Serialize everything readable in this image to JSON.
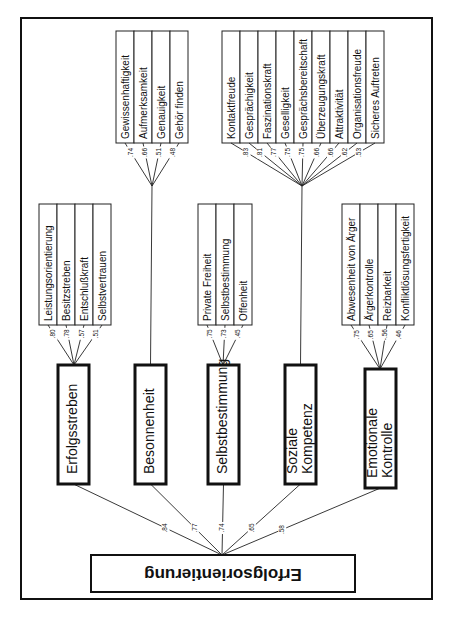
{
  "diagram": {
    "root": {
      "label": "Erfolgsorientierung"
    },
    "factors": [
      {
        "id": "erfolgsstreben",
        "label": [
          "Erfolgsstreben"
        ],
        "loading": ".84",
        "box": {
          "x": 58,
          "y": 365,
          "w": 31,
          "h": 119
        },
        "subs_box": {
          "x": 39,
          "y": 204,
          "w": 18,
          "h": 121,
          "gap": 0
        },
        "junction": {
          "x": 74,
          "y": 365
        },
        "sub_traits": [
          {
            "label": "Leistungsorientierung",
            "loading": ".80"
          },
          {
            "label": "Besitzstreben",
            "loading": ".78"
          },
          {
            "label": "Entschlußkraft",
            "loading": ".57"
          },
          {
            "label": "Selbstvertrauen",
            "loading": ".51"
          }
        ]
      },
      {
        "id": "besonnenheit",
        "label": [
          "Besonnenheit"
        ],
        "loading": ".77",
        "box": {
          "x": 135,
          "y": 365,
          "w": 31,
          "h": 119
        },
        "subs_box": {
          "x": 116,
          "y": 31,
          "w": 18,
          "h": 112,
          "gap": 0
        },
        "junction": {
          "x": 152,
          "y": 186
        },
        "sub_traits": [
          {
            "label": "Gewissenhaftigkeit",
            "loading": ".74"
          },
          {
            "label": "Aufmerksamkeit",
            "loading": ".66"
          },
          {
            "label": "Genauigkeit",
            "loading": ".51"
          },
          {
            "label": "Gehör finden",
            "loading": ".48"
          }
        ]
      },
      {
        "id": "selbstbestimmung",
        "label": [
          "Selbstbestimmung"
        ],
        "loading": ".74",
        "box": {
          "x": 208,
          "y": 365,
          "w": 31,
          "h": 119
        },
        "subs_box": {
          "x": 198,
          "y": 204,
          "w": 18,
          "h": 121,
          "gap": 0
        },
        "junction": {
          "x": 223,
          "y": 365
        },
        "sub_traits": [
          {
            "label": "Private Freiheit",
            "loading": ".75"
          },
          {
            "label": "Selbstbestimmung",
            "loading": ".73"
          },
          {
            "label": "Offenheit",
            "loading": ".45"
          }
        ]
      },
      {
        "id": "soziale-kompetenz",
        "label": [
          "Soziale",
          "Kompetenz"
        ],
        "loading": ".65",
        "box": {
          "x": 285,
          "y": 365,
          "w": 31,
          "h": 119
        },
        "subs_box": {
          "x": 222,
          "y": 31,
          "w": 18,
          "h": 112,
          "gap": 0
        },
        "junction": {
          "x": 302,
          "y": 186
        },
        "sub_traits": [
          {
            "label": "Kontaktfreude",
            "loading": ".83"
          },
          {
            "label": "Gesprächigkeit",
            "loading": ".81"
          },
          {
            "label": "Faszinationskraft",
            "loading": ".77"
          },
          {
            "label": "Geselligkeit",
            "loading": ".75"
          },
          {
            "label": "Gesprächsbereitschaft",
            "loading": ".75"
          },
          {
            "label": "Überzeugungskraft",
            "loading": ".66"
          },
          {
            "label": "Attraktivität",
            "loading": ".66"
          },
          {
            "label": "Organisationsfreude",
            "loading": ".62"
          },
          {
            "label": "Sicheres Auftreten",
            "loading": ".53"
          }
        ]
      },
      {
        "id": "emotionale-kontrolle",
        "label": [
          "Emotionale",
          "Kontrolle"
        ],
        "loading": ".58",
        "box": {
          "x": 365,
          "y": 369,
          "w": 31,
          "h": 119
        },
        "subs_box": {
          "x": 342,
          "y": 204,
          "w": 18,
          "h": 121,
          "gap": 0
        },
        "junction": {
          "x": 380,
          "y": 369
        },
        "sub_traits": [
          {
            "label": "Abwesenheit von Ärger",
            "loading": ".75"
          },
          {
            "label": "Ärgerkontrolle",
            "loading": ".65"
          },
          {
            "label": "Reizbarkeit",
            "loading": "-.56"
          },
          {
            "label": "Konfliktlösungsfertigkeit",
            "loading": ".46"
          }
        ]
      }
    ],
    "root_box": {
      "x": 91,
      "y": 555,
      "w": 264,
      "h": 37
    },
    "root_apex": {
      "x": 222,
      "y": 555
    },
    "colors": {
      "line": "#222222",
      "background": "#ffffff",
      "text": "#111111"
    }
  }
}
